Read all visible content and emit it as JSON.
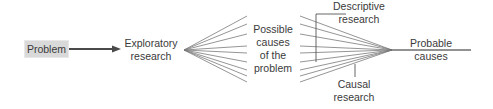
{
  "diagram": {
    "nodes": {
      "problem": {
        "label": "Problem",
        "fill": "#d9d9d9"
      },
      "exploratory": {
        "line1": "Exploratory",
        "line2": "research"
      },
      "possible_causes": {
        "line1": "Possible",
        "line2": "causes",
        "line3": "of the",
        "line4": "problem"
      },
      "probable_causes": {
        "line1": "Probable",
        "line2": "causes"
      },
      "descriptive": {
        "line1": "Descriptive",
        "line2": "research"
      },
      "causal": {
        "line1": "Causal",
        "line2": "research"
      }
    },
    "edges": [
      {
        "from": "problem",
        "to": "exploratory",
        "type": "arrow"
      },
      {
        "from": "exploratory",
        "to": "possible_causes",
        "type": "fan-out",
        "count": 9
      },
      {
        "from": "possible_causes",
        "to": "probable_causes",
        "type": "fan-in",
        "count": 9
      },
      {
        "from": "descriptive",
        "to": "fan-in",
        "type": "bracket"
      },
      {
        "from": "causal",
        "to": "fan-in",
        "type": "pointer"
      }
    ],
    "colors": {
      "line": "#6e6e6e",
      "arrow": "#4a4a4a",
      "text": "#3a3a3a"
    }
  }
}
